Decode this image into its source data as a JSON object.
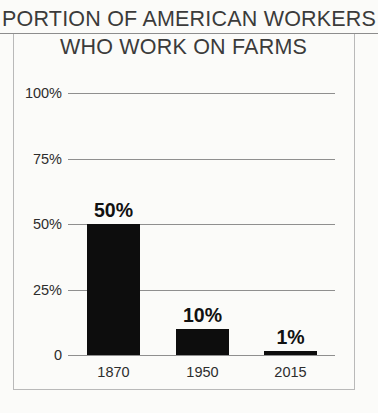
{
  "chart_data": {
    "type": "bar",
    "title": "PORTION OF AMERICAN WORKERS WHO WORK ON FARMS",
    "title_line1": "PORTION OF AMERICAN WORKERS",
    "title_line2": "WHO WORK ON FARMS",
    "xlabel": "",
    "ylabel": "",
    "categories": [
      "1870",
      "1950",
      "2015"
    ],
    "values": [
      50,
      10,
      1
    ],
    "data_labels": [
      "50%",
      "10%",
      "1%"
    ],
    "ylim": [
      0,
      100
    ],
    "yticks": [
      0,
      25,
      50,
      75,
      100
    ],
    "ytick_labels": [
      "0",
      "25%",
      "50%",
      "75%",
      "100%"
    ],
    "grid": true,
    "legend": false,
    "bar_color": "#0d0d0d",
    "grid_color": "#8f8f8f",
    "frame_color": "#b9b9b9",
    "background_color": "#fbfbf9",
    "text_color": "#2d2d2d",
    "title_color": "#3b3b3b"
  }
}
